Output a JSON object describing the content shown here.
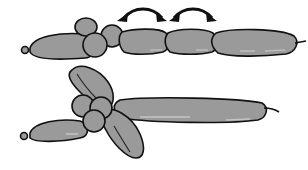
{
  "diagram": {
    "type": "balloon-twisting-instructions",
    "step1": {
      "description": "Straight balloon with first bubbles twisted; arrows show where to fold/twist next",
      "measurements": [
        {
          "label": "13 cm",
          "text": "13 cm"
        },
        {
          "label": "15 cm",
          "text": "15 cm"
        },
        {
          "label": "15 cm",
          "text": "15 cm"
        }
      ],
      "measurement_line": "|3 cm|–15 cm –|–15 cm –|",
      "arrows": 2
    },
    "step2": {
      "description": "Balloon folded into two loops (ears/wings) around the small bubbles, with long tail extending right"
    },
    "colors": {
      "balloon_fill": "#9a9a9a",
      "balloon_highlight": "#b8b8b8",
      "outline": "#111111",
      "background": "#ffffff"
    }
  }
}
